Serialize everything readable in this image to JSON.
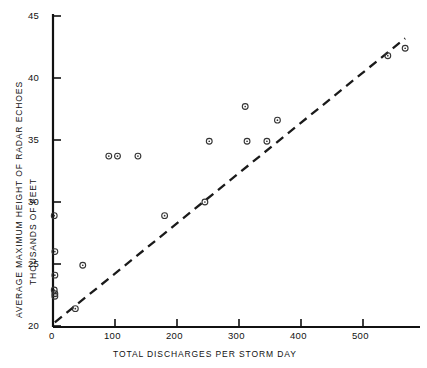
{
  "chart_data": {
    "type": "scatter",
    "title": "",
    "xlabel": "TOTAL DISCHARGES PER STORM DAY",
    "ylabel_line1": "AVERAGE MAXIMUM HEIGHT OF RADAR ECHOES",
    "ylabel_line2": "THOUSANDS OF FEET",
    "xlim": [
      0,
      570
    ],
    "ylim": [
      20,
      45
    ],
    "xticks": [
      0,
      100,
      200,
      300,
      400,
      500
    ],
    "xticklabels": [
      "0",
      "100",
      "200",
      "300",
      "400",
      "500"
    ],
    "yticks": [
      20,
      25,
      30,
      35,
      40,
      45
    ],
    "yticklabels": [
      "20",
      "25",
      "30",
      "35",
      "40",
      "45"
    ],
    "grid": false,
    "legend": null,
    "marker": "circle-with-center-dot",
    "marker_color": "#333333",
    "points": [
      {
        "x": 2,
        "y": 28.9
      },
      {
        "x": 3,
        "y": 26.0
      },
      {
        "x": 3,
        "y": 24.1
      },
      {
        "x": 2,
        "y": 22.9
      },
      {
        "x": 3,
        "y": 22.6
      },
      {
        "x": 3,
        "y": 22.4
      },
      {
        "x": 36,
        "y": 21.4
      },
      {
        "x": 48,
        "y": 24.9
      },
      {
        "x": 90,
        "y": 33.7
      },
      {
        "x": 104,
        "y": 33.7
      },
      {
        "x": 137,
        "y": 33.7
      },
      {
        "x": 180,
        "y": 28.9
      },
      {
        "x": 245,
        "y": 30.0
      },
      {
        "x": 252,
        "y": 34.9
      },
      {
        "x": 310,
        "y": 37.7
      },
      {
        "x": 313,
        "y": 34.9
      },
      {
        "x": 345,
        "y": 34.9
      },
      {
        "x": 362,
        "y": 36.6
      },
      {
        "x": 540,
        "y": 41.8
      },
      {
        "x": 568,
        "y": 42.4
      }
    ],
    "trend_line": {
      "style": "dashed",
      "color": "#1a1a1a",
      "x_start": 3,
      "y_start": 20.3,
      "x_end": 568,
      "y_end": 43.2
    }
  },
  "axes": {
    "y_axis_color": "#111111",
    "x_axis_color": "#111111"
  }
}
